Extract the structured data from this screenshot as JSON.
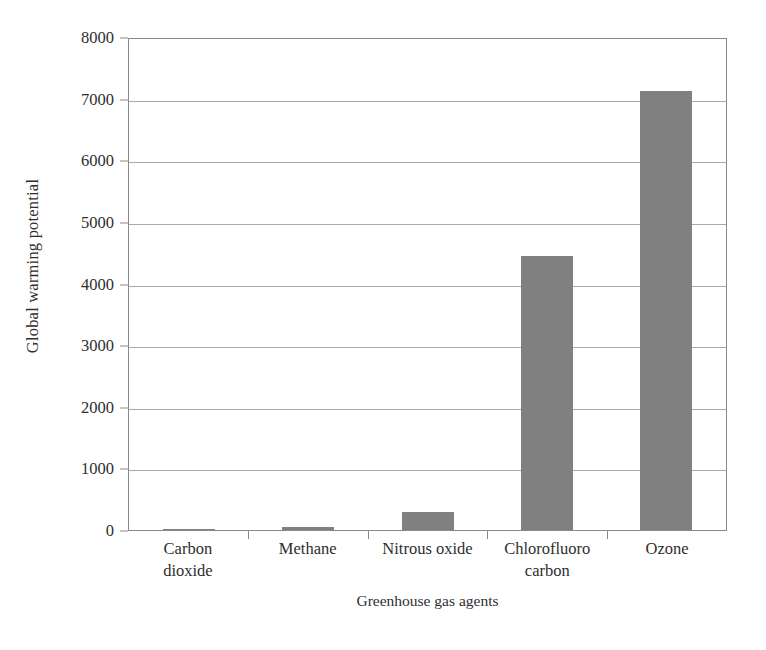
{
  "chart_data": {
    "type": "bar",
    "title": "",
    "subtitle": "",
    "xlabel": "Greenhouse gas agents",
    "ylabel": "Global warming potential",
    "categories": [
      "Carbon dioxide",
      "Methane",
      "Nitrous oxide",
      "Chlorofluoro carbon",
      "Ozone"
    ],
    "category_lines": [
      [
        "Carbon",
        "dioxide"
      ],
      [
        "Methane",
        ""
      ],
      [
        "Nitrous oxide",
        ""
      ],
      [
        "Chlorofluoro",
        "carbon"
      ],
      [
        "Ozone",
        ""
      ]
    ],
    "values": [
      1,
      50,
      300,
      4450,
      7120
    ],
    "ylim": [
      0,
      8000
    ],
    "yticks": [
      0,
      1000,
      2000,
      3000,
      4000,
      5000,
      6000,
      7000,
      8000
    ],
    "ytick_labels": [
      "0",
      "1000",
      "2000",
      "3000",
      "4000",
      "5000",
      "6000",
      "7000",
      "8000"
    ],
    "grid": "horizontal",
    "legend": "none",
    "bar_color": "#808080",
    "axis_color": "#8a8a8a",
    "grid_color": "#a9a9a9",
    "background_color": "#ffffff",
    "annotations": []
  }
}
